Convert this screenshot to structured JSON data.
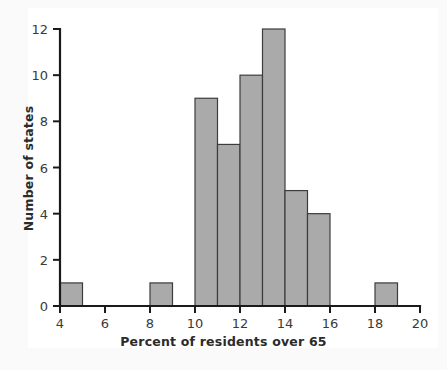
{
  "figure": {
    "background_color": "#ffffff",
    "plot_background_color": "#ffffff",
    "axis_color": "#1a1a1a",
    "bar_fill_color": "#aaaaaa",
    "bar_edge_color": "#3c3c3c",
    "text_color": "#2b2b2b"
  },
  "chart_data": {
    "type": "bar",
    "title": "",
    "subtitle": "",
    "xlabel": "Percent of residents over 65",
    "ylabel": "Number of states",
    "xlim": [
      4,
      20
    ],
    "ylim": [
      0,
      12
    ],
    "grid": false,
    "legend": null,
    "bin_width": 1,
    "xticks": [
      4,
      6,
      8,
      10,
      12,
      14,
      16,
      18,
      20
    ],
    "xtick_labels": [
      "4",
      "6",
      "8",
      "10",
      "12",
      "14",
      "16",
      "18",
      "20"
    ],
    "yticks": [
      0,
      2,
      4,
      6,
      8,
      10,
      12
    ],
    "ytick_labels": [
      "0",
      "2",
      "4",
      "6",
      "8",
      "10",
      "12"
    ],
    "bins": [
      {
        "left": 4,
        "right": 5,
        "count": 1
      },
      {
        "left": 8,
        "right": 9,
        "count": 1
      },
      {
        "left": 10,
        "right": 11,
        "count": 9
      },
      {
        "left": 11,
        "right": 12,
        "count": 7
      },
      {
        "left": 12,
        "right": 13,
        "count": 10
      },
      {
        "left": 13,
        "right": 14,
        "count": 12
      },
      {
        "left": 14,
        "right": 15,
        "count": 5
      },
      {
        "left": 15,
        "right": 16,
        "count": 4
      },
      {
        "left": 18,
        "right": 19,
        "count": 1
      }
    ],
    "categories": [
      "4-5",
      "8-9",
      "10-11",
      "11-12",
      "12-13",
      "13-14",
      "14-15",
      "15-16",
      "18-19"
    ],
    "values": [
      1,
      1,
      9,
      7,
      10,
      12,
      5,
      4,
      1
    ]
  }
}
